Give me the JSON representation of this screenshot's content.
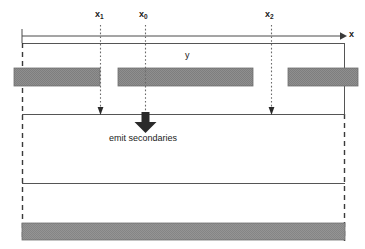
{
  "diagram": {
    "axis": {
      "name": "x-axis",
      "label": "x",
      "orientation": "horizontal",
      "arrow_direction": "right",
      "start_x": 22,
      "end_x": 345,
      "y": 36,
      "tick_at_start": true
    },
    "vertical_axis_label": "y",
    "markers": [
      {
        "id": "x1",
        "label": "x",
        "subscript": "1",
        "x": 100,
        "line_style": "dotted",
        "arrow": "small",
        "arrow_end_y": 114
      },
      {
        "id": "x0",
        "label": "x",
        "subscript": "0",
        "x": 145,
        "line_style": "dotted",
        "arrow": "large-bold",
        "arrow_end_y": 131
      },
      {
        "id": "x2",
        "label": "x",
        "subscript": "2",
        "x": 271,
        "line_style": "dotted",
        "arrow": "small",
        "arrow_end_y": 114
      }
    ],
    "annotation": {
      "name": "emit-secondaries-label",
      "text": "emit secondaries"
    },
    "outer_box": {
      "left": 22,
      "right": 345,
      "top": 43,
      "bottom": 240,
      "left_border_style": "dashed",
      "right_border_style": "solid-then-dashed",
      "top_border_style": "solid"
    },
    "horizontal_rules": [
      {
        "name": "interface-line-upper",
        "y": 114,
        "style": "solid"
      },
      {
        "name": "interface-line-lower",
        "y": 183,
        "style": "solid"
      }
    ],
    "gray_bars": [
      {
        "name": "gray-bar-left",
        "x": 14,
        "y": 68,
        "width": 86,
        "height": 18
      },
      {
        "name": "gray-bar-middle",
        "x": 118,
        "y": 68,
        "width": 135,
        "height": 18
      },
      {
        "name": "gray-bar-right",
        "x": 288,
        "y": 68,
        "width": 70,
        "height": 18
      },
      {
        "name": "gray-bar-bottom",
        "x": 22,
        "y": 223,
        "width": 323,
        "height": 17
      }
    ],
    "colors": {
      "line": "#3a3a3a",
      "gray_fill": "#8a8a8a",
      "gray_fill_light": "#9a9a9a",
      "text": "#1a1a1a",
      "background": "#ffffff"
    }
  }
}
